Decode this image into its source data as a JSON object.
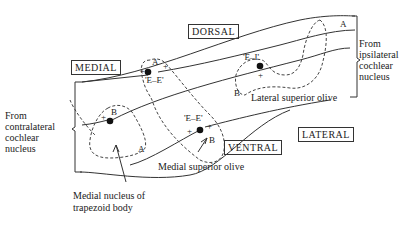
{
  "orientation_labels": {
    "dorsal": "DORSAL",
    "medial": "MEDIAL",
    "ventral": "VENTRAL",
    "lateral": "LATERAL"
  },
  "inputs": {
    "ipsilateral": [
      "From",
      "ipsilateral",
      "cochlear",
      "nucleus"
    ],
    "contralateral": [
      "From",
      "contralateral",
      "cochlear",
      "nucleus"
    ]
  },
  "nuclei": {
    "lso": {
      "name": "Lateral superior olive",
      "type": "'E–I'",
      "region_a": "A",
      "region_b": "B"
    },
    "mso_upper": {
      "type": "'E–E'",
      "region_a": "A"
    },
    "mso": {
      "name": "Medial superior olive",
      "type": "'E–E'",
      "region_b": "B"
    },
    "mntb": {
      "name_line1": "Medial nucleus of",
      "name_line2": "trapezoid body",
      "region_a": "A",
      "region_b": "B"
    }
  },
  "signs": {
    "plus": "+",
    "minus": "–"
  }
}
